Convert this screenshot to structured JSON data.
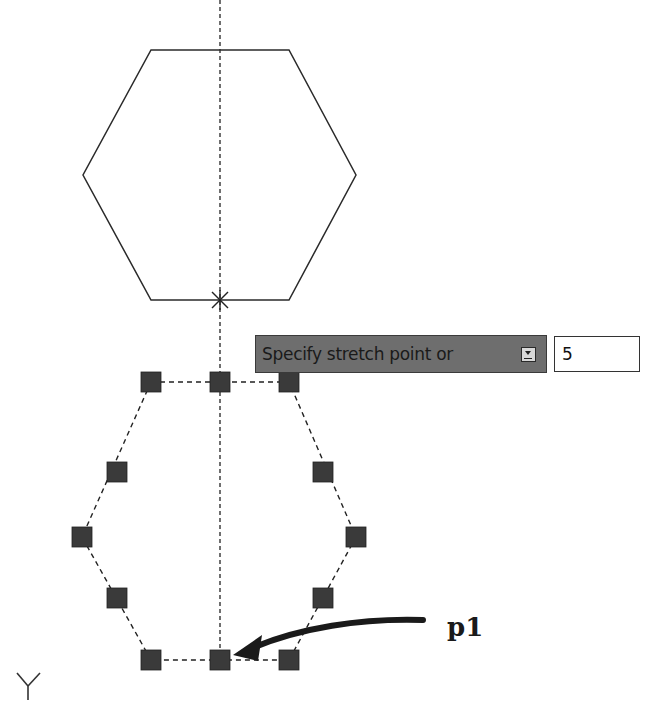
{
  "drawing": {
    "centerline_x": 220,
    "original_hexagon": {
      "vertices": [
        [
          151,
          50
        ],
        [
          289,
          50
        ],
        [
          356,
          175
        ],
        [
          289,
          300
        ],
        [
          151,
          300
        ],
        [
          83,
          175
        ]
      ],
      "base_point_marker": [
        220,
        300
      ]
    },
    "stretched_hexagon": {
      "grips": [
        [
          151,
          382
        ],
        [
          220,
          382
        ],
        [
          289,
          382
        ],
        [
          117,
          472
        ],
        [
          323,
          472
        ],
        [
          82,
          537
        ],
        [
          356,
          537
        ],
        [
          117,
          598
        ],
        [
          323,
          598
        ],
        [
          151,
          660
        ],
        [
          220,
          660
        ],
        [
          289,
          660
        ]
      ]
    },
    "grip_color": "#333333"
  },
  "command_prompt": {
    "label": "Specify stretch point or",
    "dropdown_icon": "down-arrow-icon",
    "input_value": "5"
  },
  "annotation": {
    "label": "p1",
    "arrow_target": [
      232,
      656
    ]
  },
  "ucs_icon": {
    "axis_label": "Y"
  }
}
